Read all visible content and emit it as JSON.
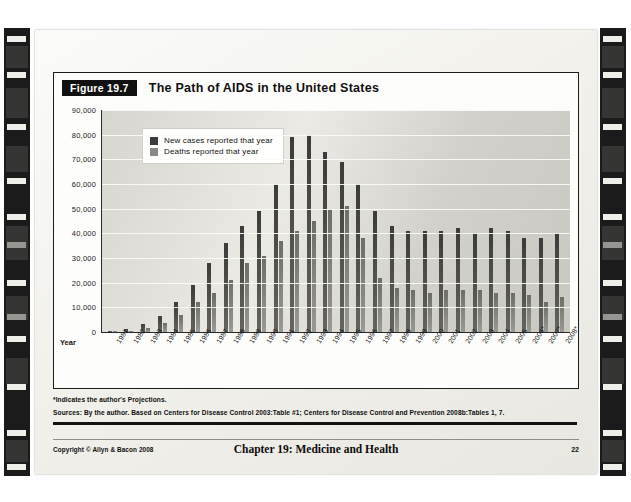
{
  "slide": {
    "figure_tag": "Figure 19.7",
    "figure_title": "The Path of AIDS in the United States",
    "year_axis_label": "Year",
    "notes": [
      "*Indicates the author's Projections.",
      "Sources: By the author. Based on Centers for Disease Control 2003:Table #1; Centers for Disease Control and Prevention 2008b:Tables 1, 7."
    ],
    "footer": {
      "copyright": "Copyright © Allyn & Bacon 2008",
      "chapter": "Chapter 19: Medicine and Health",
      "page_number": "22"
    }
  },
  "colors": {
    "cases": "#3b3b3b",
    "deaths": "#8a8a84",
    "plot_bg": "#dcdbd5",
    "slide_bg": "#f4f3ef",
    "ink": "#111111"
  },
  "chart_data": {
    "type": "bar",
    "title": "The Path of AIDS in the United States",
    "xlabel": "Year",
    "ylabel": "",
    "ylim": [
      0,
      90000
    ],
    "ytick_step": 10000,
    "ytick_labels": [
      "90,000",
      "80,000",
      "70,000",
      "60,000",
      "50,000",
      "40,000",
      "30,000",
      "20,000",
      "10,000",
      "0"
    ],
    "grid": true,
    "legend_position": "top-left",
    "categories": [
      "1981",
      "1982",
      "1983",
      "1984",
      "1985",
      "1986",
      "1987",
      "1988",
      "1989",
      "1990",
      "1991",
      "1992",
      "1993",
      "1994",
      "1995",
      "1996",
      "1997",
      "1998",
      "1999",
      "2000",
      "2001",
      "2002",
      "2003",
      "2004",
      "2005",
      "2006*",
      "2007*",
      "2008*"
    ],
    "series": [
      {
        "name": "New cases reported that year",
        "values": [
          300,
          1200,
          3100,
          6400,
          12000,
          19000,
          28000,
          36000,
          43000,
          49000,
          60000,
          79000,
          80000,
          73000,
          69000,
          60000,
          49000,
          43000,
          41000,
          41000,
          41000,
          42000,
          40000,
          42000,
          41000,
          38000,
          38000,
          40000
        ]
      },
      {
        "name": "Deaths reported that year",
        "values": [
          130,
          450,
          1500,
          3500,
          6900,
          12000,
          16000,
          21000,
          28000,
          31000,
          37000,
          41000,
          45000,
          50000,
          51000,
          38000,
          22000,
          18000,
          17000,
          16000,
          17000,
          17000,
          17000,
          16000,
          16000,
          15000,
          12000,
          14000
        ]
      }
    ]
  }
}
